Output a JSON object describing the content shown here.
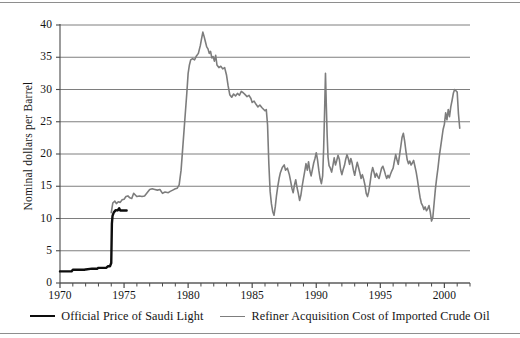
{
  "figure": {
    "ylabel": "Nominal dollars per Barrel"
  },
  "legend": {
    "items": [
      {
        "label": "Official Price of Saudi Light",
        "color": "#0d0d0d",
        "style": "black"
      },
      {
        "label": "Refiner Acquisition Cost of Imported Crude Oil",
        "color": "#7d7d7d",
        "style": "gray"
      }
    ]
  },
  "axes": {
    "y_ticks": [
      "0",
      "5",
      "10",
      "15",
      "20",
      "25",
      "30",
      "35",
      "40"
    ],
    "x_ticks": [
      "1970",
      "1975",
      "1980",
      "1985",
      "1990",
      "1995",
      "2000"
    ]
  },
  "chart_data": {
    "type": "line",
    "title": "",
    "xlabel": "",
    "ylabel": "Nominal dollars per Barrel",
    "xlim": [
      1970,
      2002
    ],
    "ylim": [
      0,
      40
    ],
    "y_ticks": [
      0,
      5,
      10,
      15,
      20,
      25,
      30,
      35,
      40
    ],
    "x_ticks": [
      1970,
      1975,
      1980,
      1985,
      1990,
      1995,
      2000
    ],
    "x_minor_tick_step": 1,
    "grid": "horizontal",
    "legend_position": "below-axes",
    "series": [
      {
        "name": "Official Price of Saudi Light",
        "color": "#0d0d0d",
        "linewidth": 2.4,
        "points": [
          [
            1970.0,
            1.8
          ],
          [
            1970.9,
            1.8
          ],
          [
            1971.0,
            2.05
          ],
          [
            1971.9,
            2.05
          ],
          [
            1972.0,
            2.1
          ],
          [
            1972.5,
            2.22
          ],
          [
            1972.9,
            2.22
          ],
          [
            1973.0,
            2.35
          ],
          [
            1973.6,
            2.35
          ],
          [
            1973.75,
            2.6
          ],
          [
            1973.9,
            2.6
          ],
          [
            1974.0,
            3.1
          ],
          [
            1974.05,
            9.2
          ],
          [
            1974.1,
            10.4
          ],
          [
            1974.2,
            10.95
          ],
          [
            1974.35,
            11.3
          ],
          [
            1974.5,
            11.25
          ],
          [
            1974.62,
            11.6
          ],
          [
            1974.7,
            11.25
          ],
          [
            1975.0,
            11.25
          ],
          [
            1975.2,
            11.25
          ]
        ]
      },
      {
        "name": "Refiner Acquisition Cost of Imported Crude Oil",
        "color": "#7d7d7d",
        "linewidth": 1.6,
        "points": [
          [
            1974.0,
            10.9
          ],
          [
            1974.12,
            12.4
          ],
          [
            1974.28,
            12.7
          ],
          [
            1974.4,
            12.3
          ],
          [
            1974.55,
            12.6
          ],
          [
            1974.7,
            12.5
          ],
          [
            1974.85,
            12.9
          ],
          [
            1975.0,
            13.0
          ],
          [
            1975.15,
            13.4
          ],
          [
            1975.3,
            13.5
          ],
          [
            1975.45,
            13.2
          ],
          [
            1975.6,
            13.1
          ],
          [
            1975.75,
            13.9
          ],
          [
            1975.9,
            13.6
          ],
          [
            1976.0,
            13.4
          ],
          [
            1976.2,
            13.5
          ],
          [
            1976.4,
            13.4
          ],
          [
            1976.6,
            13.5
          ],
          [
            1976.8,
            14.0
          ],
          [
            1977.0,
            14.5
          ],
          [
            1977.2,
            14.6
          ],
          [
            1977.4,
            14.5
          ],
          [
            1977.6,
            14.4
          ],
          [
            1977.8,
            14.5
          ],
          [
            1978.0,
            13.9
          ],
          [
            1978.2,
            14.1
          ],
          [
            1978.45,
            14.0
          ],
          [
            1978.6,
            14.2
          ],
          [
            1978.8,
            14.4
          ],
          [
            1979.0,
            14.6
          ],
          [
            1979.15,
            14.7
          ],
          [
            1979.3,
            15.2
          ],
          [
            1979.45,
            17.5
          ],
          [
            1979.6,
            21.5
          ],
          [
            1979.75,
            25.5
          ],
          [
            1979.9,
            29.5
          ],
          [
            1980.0,
            32.5
          ],
          [
            1980.1,
            33.8
          ],
          [
            1980.2,
            34.6
          ],
          [
            1980.35,
            34.8
          ],
          [
            1980.5,
            34.6
          ],
          [
            1980.65,
            35.2
          ],
          [
            1980.8,
            35.6
          ],
          [
            1980.95,
            36.8
          ],
          [
            1981.05,
            37.9
          ],
          [
            1981.15,
            38.9
          ],
          [
            1981.25,
            38.2
          ],
          [
            1981.35,
            37.4
          ],
          [
            1981.45,
            36.6
          ],
          [
            1981.55,
            36.3
          ],
          [
            1981.65,
            35.6
          ],
          [
            1981.75,
            35.9
          ],
          [
            1981.85,
            34.9
          ],
          [
            1981.95,
            35.1
          ],
          [
            1982.05,
            34.4
          ],
          [
            1982.15,
            35.3
          ],
          [
            1982.25,
            33.8
          ],
          [
            1982.4,
            33.4
          ],
          [
            1982.55,
            33.6
          ],
          [
            1982.7,
            33.2
          ],
          [
            1982.85,
            33.4
          ],
          [
            1983.0,
            32.2
          ],
          [
            1983.12,
            30.6
          ],
          [
            1983.25,
            29.2
          ],
          [
            1983.4,
            28.8
          ],
          [
            1983.55,
            29.3
          ],
          [
            1983.7,
            29.0
          ],
          [
            1983.85,
            29.4
          ],
          [
            1984.0,
            29.1
          ],
          [
            1984.15,
            29.7
          ],
          [
            1984.3,
            29.5
          ],
          [
            1984.45,
            29.2
          ],
          [
            1984.6,
            28.9
          ],
          [
            1984.75,
            29.1
          ],
          [
            1984.9,
            28.6
          ],
          [
            1985.0,
            28.0
          ],
          [
            1985.15,
            28.2
          ],
          [
            1985.3,
            27.7
          ],
          [
            1985.45,
            27.3
          ],
          [
            1985.6,
            27.6
          ],
          [
            1985.75,
            27.2
          ],
          [
            1985.9,
            26.9
          ],
          [
            1986.0,
            26.7
          ],
          [
            1986.1,
            26.9
          ],
          [
            1986.2,
            24.5
          ],
          [
            1986.3,
            18.5
          ],
          [
            1986.4,
            14.2
          ],
          [
            1986.5,
            12.3
          ],
          [
            1986.6,
            11.1
          ],
          [
            1986.7,
            10.5
          ],
          [
            1986.8,
            11.8
          ],
          [
            1986.9,
            13.6
          ],
          [
            1987.0,
            15.0
          ],
          [
            1987.1,
            16.2
          ],
          [
            1987.2,
            17.1
          ],
          [
            1987.35,
            17.9
          ],
          [
            1987.5,
            18.3
          ],
          [
            1987.6,
            17.5
          ],
          [
            1987.75,
            17.8
          ],
          [
            1987.9,
            16.8
          ],
          [
            1988.0,
            15.8
          ],
          [
            1988.1,
            14.7
          ],
          [
            1988.2,
            14.0
          ],
          [
            1988.3,
            15.2
          ],
          [
            1988.4,
            16.0
          ],
          [
            1988.5,
            14.8
          ],
          [
            1988.6,
            13.9
          ],
          [
            1988.7,
            12.8
          ],
          [
            1988.8,
            13.6
          ],
          [
            1988.9,
            15.0
          ],
          [
            1989.0,
            16.2
          ],
          [
            1989.1,
            17.3
          ],
          [
            1989.2,
            18.5
          ],
          [
            1989.3,
            17.5
          ],
          [
            1989.4,
            18.8
          ],
          [
            1989.5,
            17.4
          ],
          [
            1989.6,
            16.6
          ],
          [
            1989.7,
            17.6
          ],
          [
            1989.8,
            18.6
          ],
          [
            1989.9,
            19.3
          ],
          [
            1990.0,
            20.2
          ],
          [
            1990.1,
            19.1
          ],
          [
            1990.2,
            17.5
          ],
          [
            1990.3,
            16.2
          ],
          [
            1990.4,
            15.4
          ],
          [
            1990.5,
            16.6
          ],
          [
            1990.58,
            21.0
          ],
          [
            1990.65,
            26.5
          ],
          [
            1990.72,
            32.5
          ],
          [
            1990.78,
            28.0
          ],
          [
            1990.85,
            23.0
          ],
          [
            1990.92,
            19.5
          ],
          [
            1991.0,
            18.2
          ],
          [
            1991.1,
            17.8
          ],
          [
            1991.2,
            17.2
          ],
          [
            1991.3,
            18.2
          ],
          [
            1991.4,
            19.4
          ],
          [
            1991.5,
            18.3
          ],
          [
            1991.6,
            19.0
          ],
          [
            1991.7,
            19.8
          ],
          [
            1991.8,
            19.2
          ],
          [
            1991.9,
            17.6
          ],
          [
            1992.0,
            16.8
          ],
          [
            1992.1,
            17.6
          ],
          [
            1992.2,
            18.2
          ],
          [
            1992.3,
            19.2
          ],
          [
            1992.4,
            19.9
          ],
          [
            1992.5,
            19.3
          ],
          [
            1992.6,
            18.4
          ],
          [
            1992.7,
            19.3
          ],
          [
            1992.8,
            18.6
          ],
          [
            1992.9,
            17.5
          ],
          [
            1993.0,
            16.7
          ],
          [
            1993.1,
            17.8
          ],
          [
            1993.2,
            18.7
          ],
          [
            1993.3,
            17.9
          ],
          [
            1993.4,
            17.1
          ],
          [
            1993.5,
            16.2
          ],
          [
            1993.6,
            16.8
          ],
          [
            1993.7,
            16.1
          ],
          [
            1993.8,
            15.2
          ],
          [
            1993.9,
            13.9
          ],
          [
            1994.0,
            13.4
          ],
          [
            1994.1,
            14.2
          ],
          [
            1994.2,
            15.5
          ],
          [
            1994.3,
            17.0
          ],
          [
            1994.4,
            17.9
          ],
          [
            1994.5,
            17.2
          ],
          [
            1994.6,
            16.4
          ],
          [
            1994.7,
            17.0
          ],
          [
            1994.8,
            16.5
          ],
          [
            1994.9,
            16.2
          ],
          [
            1995.0,
            17.0
          ],
          [
            1995.1,
            17.8
          ],
          [
            1995.2,
            18.1
          ],
          [
            1995.3,
            17.5
          ],
          [
            1995.4,
            16.8
          ],
          [
            1995.5,
            16.2
          ],
          [
            1995.6,
            16.7
          ],
          [
            1995.7,
            16.3
          ],
          [
            1995.8,
            16.9
          ],
          [
            1995.9,
            17.4
          ],
          [
            1996.0,
            17.8
          ],
          [
            1996.1,
            18.9
          ],
          [
            1996.2,
            19.9
          ],
          [
            1996.3,
            19.1
          ],
          [
            1996.4,
            18.4
          ],
          [
            1996.5,
            19.8
          ],
          [
            1996.6,
            21.2
          ],
          [
            1996.7,
            22.6
          ],
          [
            1996.8,
            23.2
          ],
          [
            1996.9,
            22.0
          ],
          [
            1997.0,
            20.4
          ],
          [
            1997.1,
            19.1
          ],
          [
            1997.2,
            18.5
          ],
          [
            1997.3,
            18.9
          ],
          [
            1997.4,
            18.3
          ],
          [
            1997.5,
            18.6
          ],
          [
            1997.6,
            19.0
          ],
          [
            1997.7,
            18.1
          ],
          [
            1997.8,
            17.2
          ],
          [
            1997.9,
            16.0
          ],
          [
            1998.0,
            14.6
          ],
          [
            1998.1,
            13.3
          ],
          [
            1998.2,
            12.4
          ],
          [
            1998.3,
            12.0
          ],
          [
            1998.4,
            11.4
          ],
          [
            1998.5,
            11.8
          ],
          [
            1998.6,
            11.2
          ],
          [
            1998.7,
            11.5
          ],
          [
            1998.8,
            12.0
          ],
          [
            1998.9,
            11.0
          ],
          [
            1999.0,
            9.6
          ],
          [
            1999.1,
            10.2
          ],
          [
            1999.2,
            12.4
          ],
          [
            1999.3,
            14.6
          ],
          [
            1999.4,
            16.3
          ],
          [
            1999.5,
            17.8
          ],
          [
            1999.6,
            19.6
          ],
          [
            1999.7,
            21.0
          ],
          [
            1999.8,
            22.4
          ],
          [
            1999.9,
            23.8
          ],
          [
            2000.0,
            24.6
          ],
          [
            2000.1,
            26.4
          ],
          [
            2000.2,
            25.3
          ],
          [
            2000.3,
            26.9
          ],
          [
            2000.4,
            25.8
          ],
          [
            2000.5,
            27.3
          ],
          [
            2000.6,
            28.3
          ],
          [
            2000.7,
            29.4
          ],
          [
            2000.8,
            30.0
          ],
          [
            2000.9,
            29.8
          ],
          [
            2001.0,
            29.6
          ],
          [
            2001.1,
            26.2
          ],
          [
            2001.2,
            24.0
          ]
        ]
      }
    ]
  }
}
